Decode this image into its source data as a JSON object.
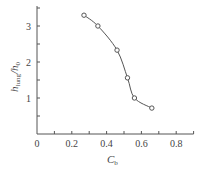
{
  "chart_data": {
    "type": "scatter",
    "title": "",
    "xlabel": "C_b",
    "ylabel": "h_lung/h_0",
    "xlim": [
      0,
      0.9
    ],
    "ylim": [
      0,
      3.5
    ],
    "x_ticks": [
      0,
      0.1,
      0.2,
      0.3,
      0.4,
      0.5,
      0.6,
      0.7,
      0.8,
      0.9
    ],
    "x_tick_labels": [
      "0",
      "",
      "0.2",
      "",
      "0.4",
      "",
      "0.6",
      "",
      "0.8",
      ""
    ],
    "y_ticks": [
      0.5,
      1,
      1.5,
      2,
      2.5,
      3,
      3.5
    ],
    "y_tick_labels": [
      "",
      "1",
      "",
      "2",
      "",
      "3",
      ""
    ],
    "grid": false,
    "legend": null,
    "series": [
      {
        "name": "measured",
        "marker": "open-circle",
        "line": "smooth-fit",
        "x": [
          0.27,
          0.35,
          0.46,
          0.52,
          0.56,
          0.66
        ],
        "y": [
          3.3,
          3.0,
          2.33,
          1.56,
          1.0,
          0.72
        ]
      }
    ]
  },
  "labels": {
    "x_main": "C",
    "x_sub": "b",
    "y_main_a": "h",
    "y_sub_a": "lung",
    "y_sep": "/h",
    "y_sub_b": "0"
  },
  "colors": {
    "axis": "#555555",
    "line": "#555555",
    "marker": "#555555",
    "background": "#ffffff"
  }
}
